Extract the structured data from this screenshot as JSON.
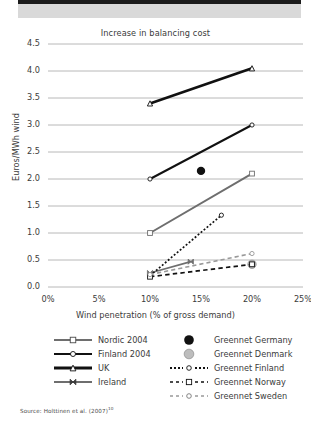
{
  "figure": {
    "source_prefix": "Source: Holttinen et al. (2007)",
    "source_superscript": "10"
  },
  "chart_data": {
    "type": "line",
    "title": "Increase in balancing cost",
    "xlabel": "Wind penetration (% of gross demand)",
    "ylabel": "Euros/MWh wind",
    "xlim": [
      0,
      25
    ],
    "ylim": [
      0.0,
      4.5
    ],
    "xticks": [
      "0%",
      "5%",
      "10%",
      "15%",
      "20%",
      "25%"
    ],
    "xtick_values": [
      0,
      5,
      10,
      15,
      20,
      25
    ],
    "yticks": [
      "0.0",
      "0.5",
      "1.0",
      "1.5",
      "2.0",
      "2.5",
      "3.0",
      "3.5",
      "4.0",
      "4.5"
    ],
    "ytick_values": [
      0.0,
      0.5,
      1.0,
      1.5,
      2.0,
      2.5,
      3.0,
      3.5,
      4.0,
      4.5
    ],
    "grid": "horizontal",
    "legend_position": "below",
    "series": [
      {
        "name": "Nordic 2004",
        "marker": "square-open",
        "line": "solid",
        "color": "#6e6e6e",
        "width": 2.0,
        "x": [
          10,
          20
        ],
        "y": [
          1.0,
          2.1
        ]
      },
      {
        "name": "Finland 2004",
        "marker": "circle-open",
        "line": "solid",
        "color": "#111111",
        "width": 2.0,
        "x": [
          10,
          20
        ],
        "y": [
          2.0,
          3.0
        ]
      },
      {
        "name": "UK",
        "marker": "triangle-open",
        "line": "solid",
        "color": "#111111",
        "width": 2.6,
        "x": [
          10,
          20
        ],
        "y": [
          3.4,
          4.05
        ]
      },
      {
        "name": "Ireland",
        "marker": "bowtie",
        "line": "solid",
        "color": "#6e6e6e",
        "width": 1.6,
        "x": [
          10,
          14
        ],
        "y": [
          0.26,
          0.47
        ]
      },
      {
        "name": "Greennet Germany",
        "marker": "circle-filled",
        "line": "none",
        "color": "#111111",
        "width": 0,
        "x": [
          15
        ],
        "y": [
          2.15
        ]
      },
      {
        "name": "Greennet Denmark",
        "marker": "circle-filled-gray",
        "line": "none",
        "color": "#b4b4b4",
        "width": 0,
        "x": [
          20
        ],
        "y": [
          0.42
        ]
      },
      {
        "name": "Greennet Finland",
        "marker": "circle-open",
        "line": "dotted",
        "color": "#111111",
        "width": 1.7,
        "x": [
          10,
          17
        ],
        "y": [
          0.21,
          1.33
        ]
      },
      {
        "name": "Greennet Norway",
        "marker": "square-open",
        "line": "dashed",
        "color": "#111111",
        "width": 1.7,
        "x": [
          10,
          20
        ],
        "y": [
          0.19,
          0.42
        ]
      },
      {
        "name": "Greennet Sweden",
        "marker": "circle-open",
        "line": "dashed",
        "color": "#999999",
        "width": 1.6,
        "x": [
          10,
          20
        ],
        "y": [
          0.23,
          0.62
        ]
      }
    ],
    "legend_left": [
      {
        "label": "Nordic 2004",
        "key": "line-square-gray"
      },
      {
        "label": "Finland 2004",
        "key": "line-circle-black"
      },
      {
        "label": "UK",
        "key": "line-triangle-black-thick"
      },
      {
        "label": "Ireland",
        "key": "line-bowtie-gray"
      }
    ],
    "legend_right": [
      {
        "label": "Greennet Germany",
        "key": "dot-black"
      },
      {
        "label": "Greennet Denmark",
        "key": "dot-gray"
      },
      {
        "label": "Greennet Finland",
        "key": "dotted-circle-black"
      },
      {
        "label": "Greennet Norway",
        "key": "dashed-square-black"
      },
      {
        "label": "Greennet Sweden",
        "key": "dashed-circle-gray"
      }
    ]
  }
}
